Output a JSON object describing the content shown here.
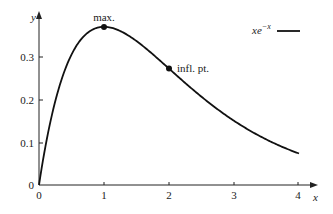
{
  "chart_data": {
    "type": "line",
    "title": "",
    "xlabel": "x",
    "ylabel": "y",
    "function": "x e^{-x}",
    "xlim": [
      0,
      4.25
    ],
    "ylim": [
      0,
      0.4
    ],
    "x_ticks": [
      0,
      1,
      2,
      3,
      4
    ],
    "y_ticks": [
      0,
      0.1,
      0.2,
      0.3
    ],
    "x_tick_labels": [
      "0",
      "1",
      "2",
      "3",
      "4"
    ],
    "y_tick_labels": [
      "0",
      "0.1",
      "0.2",
      "0.3"
    ],
    "grid": false,
    "legend": {
      "position": "top-right",
      "entries": [
        "xe^{-x}"
      ]
    },
    "series": [
      {
        "name": "xe^{-x}",
        "x": [
          0,
          0.25,
          0.5,
          0.75,
          1,
          1.5,
          2,
          2.5,
          3,
          3.5,
          4
        ],
        "values": [
          0,
          0.195,
          0.303,
          0.354,
          0.368,
          0.335,
          0.271,
          0.205,
          0.149,
          0.106,
          0.073
        ]
      }
    ],
    "annotations": [
      {
        "label": "max.",
        "x": 1,
        "y": 0.368
      },
      {
        "label": "infl. pt.",
        "x": 2,
        "y": 0.271
      }
    ]
  },
  "labels": {
    "y_axis": "y",
    "x_axis": "x",
    "max": "max.",
    "infl": "infl. pt.",
    "legend_base": "xe",
    "legend_exp": "−x",
    "origin_y": "0",
    "x0": "0",
    "x1": "1",
    "x2": "2",
    "x3": "3",
    "x4": "4",
    "y1": "0.1",
    "y2": "0.2",
    "y3": "0.3"
  }
}
